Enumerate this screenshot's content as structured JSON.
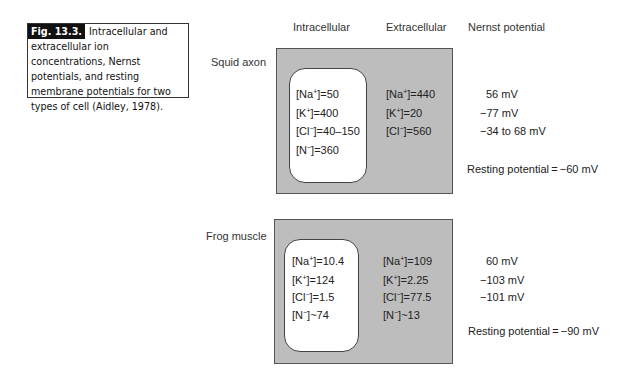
{
  "caption": {
    "fig_label": "Fig. 13.3.",
    "text": "Intracellular and extracellular ion concentrations, Nernst potentials, and resting membrane potentials for two types of cell (Aidley, 1978)."
  },
  "column_headers": {
    "intracellular": "Intracellular",
    "extracellular": "Extracellular",
    "nernst": "Nernst potential"
  },
  "cells": [
    {
      "name": "Squid axon",
      "intracellular": [
        {
          "ion": "Na",
          "charge": "+",
          "op": "=",
          "value": "50"
        },
        {
          "ion": "K",
          "charge": "+",
          "op": "=",
          "value": "400"
        },
        {
          "ion": "Cl",
          "charge": "−",
          "op": "=",
          "value": "40–150"
        },
        {
          "ion": "N",
          "charge": "−",
          "op": "=",
          "value": "360"
        }
      ],
      "extracellular": [
        {
          "ion": "Na",
          "charge": "+",
          "op": "=",
          "value": "440"
        },
        {
          "ion": "K",
          "charge": "+",
          "op": "=",
          "value": "20"
        },
        {
          "ion": "Cl",
          "charge": "−",
          "op": "=",
          "value": "560"
        }
      ],
      "nernst": [
        "56 mV",
        "−77 mV",
        "−34 to 68 mV"
      ],
      "resting": "Resting potential = −60 mV"
    },
    {
      "name": "Frog muscle",
      "intracellular": [
        {
          "ion": "Na",
          "charge": "+",
          "op": "=",
          "value": "10.4"
        },
        {
          "ion": "K",
          "charge": "+",
          "op": "=",
          "value": "124"
        },
        {
          "ion": "Cl",
          "charge": "−",
          "op": "=",
          "value": "1.5"
        },
        {
          "ion": "N",
          "charge": "−",
          "op": "~",
          "value": "74"
        }
      ],
      "extracellular": [
        {
          "ion": "Na",
          "charge": "+",
          "op": "=",
          "value": "109"
        },
        {
          "ion": "K",
          "charge": "+",
          "op": "=",
          "value": "2.25"
        },
        {
          "ion": "Cl",
          "charge": "−",
          "op": "=",
          "value": "77.5"
        },
        {
          "ion": "N",
          "charge": "−",
          "op": "~",
          "value": "13"
        }
      ],
      "nernst": [
        "60 mV",
        "−103 mV",
        "−101 mV"
      ],
      "resting": "Resting potential = −90 mV"
    }
  ],
  "colors": {
    "membrane_fill": "#bdbdbd",
    "cell_fill": "#ffffff",
    "caption_label_bg": "#111111"
  }
}
